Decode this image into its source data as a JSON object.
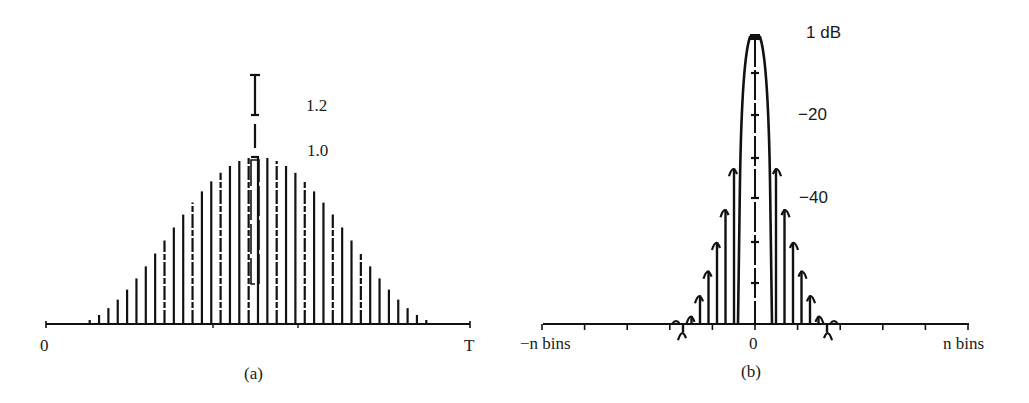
{
  "figure": {
    "panels": [
      {
        "id": "a",
        "caption": "(a)",
        "x_labels": {
          "start": "0",
          "end": "T"
        },
        "y_labels": {
          "upper": "1.2",
          "peak": "1.0"
        },
        "description": "Sampled raised-cosine (Hanning-like) window: vertical sample lines under a bell-shaped envelope from 0 to T, peak normalized to 1.0, with an I-beam scale marker extending to 1.2 at the center."
      },
      {
        "id": "b",
        "caption": "(b)",
        "x_labels": {
          "start": "−n bins",
          "center": "0",
          "end": "n bins"
        },
        "y_labels": {
          "top": "1 dB",
          "mid": "−20",
          "low": "−40"
        },
        "description": "Spectrum of the window on a dB scale: narrow main lobe centered at 0 bins with decaying side lobes, plotted between −n bins and n bins."
      }
    ],
    "colors": {
      "ink": "#111111",
      "background": "#ffffff"
    }
  },
  "chart_data": [
    {
      "type": "bar",
      "title": "(a)",
      "xlabel": "time",
      "ylabel": "amplitude",
      "x_range_labels": [
        "0",
        "T"
      ],
      "y_ticks": [
        1.0,
        1.2
      ],
      "ylim": [
        0,
        1.2
      ],
      "n_samples": 41,
      "envelope": "raised-cosine",
      "x": [
        0,
        0.025,
        0.05,
        0.075,
        0.1,
        0.125,
        0.15,
        0.175,
        0.2,
        0.225,
        0.25,
        0.275,
        0.3,
        0.325,
        0.35,
        0.375,
        0.4,
        0.425,
        0.45,
        0.475,
        0.5,
        0.525,
        0.55,
        0.575,
        0.6,
        0.625,
        0.65,
        0.675,
        0.7,
        0.725,
        0.75,
        0.775,
        0.8,
        0.825,
        0.85,
        0.875,
        0.9,
        0.925,
        0.95,
        0.975,
        1.0
      ],
      "values": [
        0,
        0.006,
        0.024,
        0.054,
        0.095,
        0.146,
        0.206,
        0.273,
        0.345,
        0.422,
        0.5,
        0.578,
        0.655,
        0.727,
        0.794,
        0.854,
        0.905,
        0.946,
        0.976,
        0.994,
        1.0,
        0.994,
        0.976,
        0.946,
        0.905,
        0.854,
        0.794,
        0.727,
        0.655,
        0.578,
        0.5,
        0.422,
        0.345,
        0.273,
        0.206,
        0.146,
        0.095,
        0.054,
        0.024,
        0.006,
        0
      ],
      "annotations": [
        "I-beam marker at center spanning 1.0 to 1.2"
      ],
      "grid": false
    },
    {
      "type": "line",
      "title": "(b)",
      "xlabel": "frequency (bins)",
      "ylabel": "dB",
      "x_range_labels": [
        "−n bins",
        "0",
        "n bins"
      ],
      "x_ticks": [
        -10,
        -8,
        -6,
        -4,
        -2,
        0,
        2,
        4,
        6,
        8,
        10
      ],
      "y_tick_labels": [
        "1 dB",
        "−20",
        "−40"
      ],
      "ylim": [
        -80,
        0
      ],
      "main_lobe": {
        "center": 0,
        "peak_db": 0
      },
      "side_lobes_db_approx": [
        -32,
        -42,
        -50,
        -57,
        -63,
        -68,
        -72
      ],
      "grid": false
    }
  ]
}
